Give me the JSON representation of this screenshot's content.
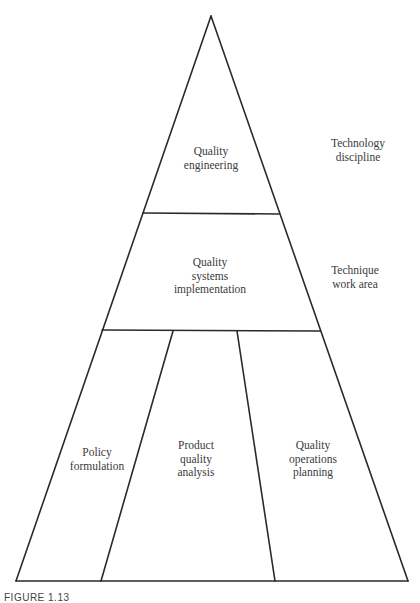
{
  "diagram": {
    "type": "pyramid",
    "levels": [
      {
        "id": "top",
        "sections": [
          {
            "label": "Quality\nengineering"
          }
        ],
        "side_label": "Technology\ndiscipline"
      },
      {
        "id": "middle",
        "sections": [
          {
            "label": "Quality\nsystems\nimplementation"
          }
        ],
        "side_label": "Technique work area"
      },
      {
        "id": "bottom",
        "sections": [
          {
            "label": "Policy\nformulation"
          },
          {
            "label": "Product\nquality\nanalysis"
          },
          {
            "label": "Quality\noperations\nplanning"
          }
        ],
        "side_label": ""
      }
    ]
  },
  "caption": "FIGURE 1.13"
}
